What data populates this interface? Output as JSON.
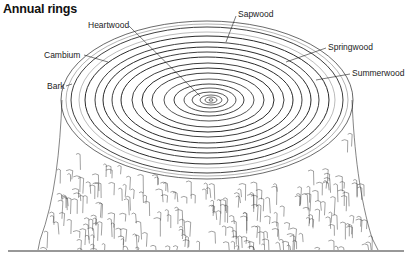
{
  "title": "Annual rings",
  "labels": {
    "heartwood": "Heartwood",
    "sapwood": "Sapwood",
    "cambium": "Cambium",
    "springwood": "Springwood",
    "summerwood": "Summerwood",
    "bark": "Bark"
  },
  "colors": {
    "ink": "#2a2a2a",
    "background": "#ffffff"
  }
}
